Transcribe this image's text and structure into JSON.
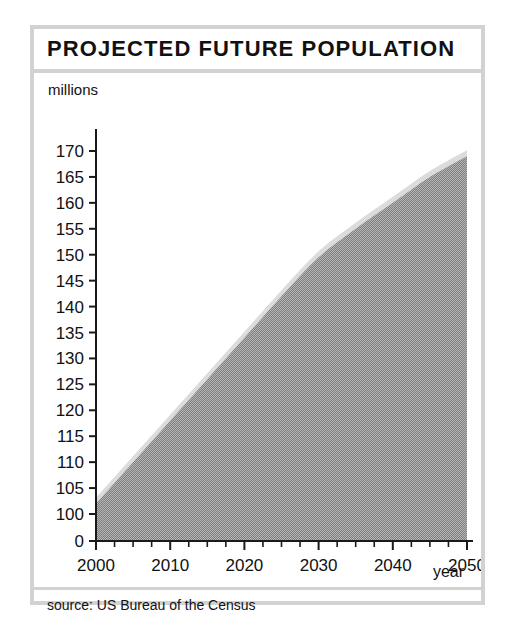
{
  "figure": {
    "title": "PROJECTED FUTURE POPULATION",
    "source_note": "source: US Bureau of the Census",
    "frame_color": "#d2d2d2"
  },
  "chart_data": {
    "type": "area",
    "title": "PROJECTED FUTURE POPULATION",
    "xlabel": "year",
    "ylabel": "millions",
    "ylabel_position": "above-axis",
    "xlim": [
      2000,
      2050
    ],
    "ylim": [
      100,
      170
    ],
    "y_axis_break": true,
    "y_break_note": "axis shows 0 then jumps to 100",
    "grid": false,
    "legend": false,
    "fill_color": "#949494",
    "band_color": "#dcdcdc",
    "x_ticks": [
      2000,
      2010,
      2020,
      2030,
      2040,
      2050
    ],
    "x_tick_labels": [
      "2000",
      "2010",
      "2020",
      "2030",
      "2040",
      "2050"
    ],
    "x_minor_tick_step": 2.5,
    "y_ticks": [
      0,
      100,
      105,
      110,
      115,
      120,
      125,
      130,
      135,
      140,
      145,
      150,
      155,
      160,
      165,
      170
    ],
    "y_tick_labels": [
      "0",
      "100",
      "105",
      "110",
      "115",
      "120",
      "125",
      "130",
      "135",
      "140",
      "145",
      "150",
      "155",
      "160",
      "165",
      "170"
    ],
    "x": [
      2000,
      2005,
      2010,
      2015,
      2020,
      2025,
      2030,
      2035,
      2040,
      2045,
      2050
    ],
    "values": [
      102,
      110,
      118,
      126,
      134,
      142,
      149.5,
      155,
      160,
      165,
      169
    ],
    "series": [
      {
        "name": "Projected population",
        "units": "millions",
        "x": [
          2000,
          2005,
          2010,
          2015,
          2020,
          2025,
          2030,
          2035,
          2040,
          2045,
          2050
        ],
        "values": [
          102,
          110,
          118,
          126,
          134,
          142,
          149.5,
          155,
          160,
          165,
          169
        ]
      }
    ]
  }
}
